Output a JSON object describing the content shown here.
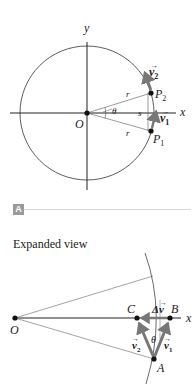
{
  "figure": {
    "top_diagram": {
      "axes": {
        "x_label": "x",
        "y_label": "y"
      },
      "origin_label": "O",
      "points": [
        {
          "id": "P2",
          "label": "P",
          "subscript": "2"
        },
        {
          "id": "P1",
          "label": "P",
          "subscript": "1"
        }
      ],
      "vectors": [
        {
          "id": "v2",
          "label": "v",
          "subscript": "2",
          "arrow": "→"
        },
        {
          "id": "v1",
          "label": "v",
          "subscript": "1",
          "arrow": "→"
        }
      ],
      "radius_label": "r",
      "angle_label": "θ",
      "arc_label": "s"
    },
    "panel_badge": "A",
    "bottom_diagram": {
      "caption": "Expanded view",
      "origin_label": "O",
      "x_label": "x",
      "points": {
        "A": "A",
        "B": "B",
        "C": "C"
      },
      "vectors": {
        "v1": {
          "label": "v",
          "subscript": "1",
          "arrow": "→"
        },
        "v2": {
          "label": "v",
          "subscript": "2",
          "arrow": "→"
        },
        "dv": {
          "label": "Δv",
          "arrow": "→"
        }
      },
      "angle_label": "θ"
    },
    "colors": {
      "line": "#333333",
      "vector": "#777777",
      "badge": "#9a9a9a",
      "divider": "#d8d8d8"
    }
  }
}
